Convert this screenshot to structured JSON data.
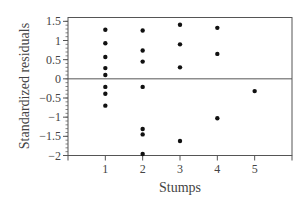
{
  "chart_data": {
    "type": "scatter",
    "title": "",
    "xlabel": "Stumps",
    "ylabel": "Standardized residuals",
    "xlim": [
      0,
      6
    ],
    "ylim": [
      -2,
      1.6
    ],
    "xticks": [
      1,
      2,
      3,
      4,
      5
    ],
    "xtick_labels": [
      "1",
      "2",
      "3",
      "4",
      "5"
    ],
    "yticks": [
      1.5,
      1,
      0.5,
      0,
      -0.5,
      -1,
      -1.5,
      -2
    ],
    "ytick_labels": [
      "1.5",
      "1",
      "0.5",
      "0",
      "−0.5",
      "−1",
      "−1.5",
      "−2"
    ],
    "y_minor_tick_step": 0.1,
    "reference_line": {
      "y": 0
    },
    "grid": false,
    "legend": null,
    "series": [
      {
        "name": "residuals",
        "points": [
          {
            "x": 1,
            "y": 1.28
          },
          {
            "x": 1,
            "y": 0.93
          },
          {
            "x": 1,
            "y": 0.57
          },
          {
            "x": 1,
            "y": 0.28
          },
          {
            "x": 1,
            "y": 0.1
          },
          {
            "x": 1,
            "y": -0.21
          },
          {
            "x": 1,
            "y": -0.39
          },
          {
            "x": 1,
            "y": -0.7
          },
          {
            "x": 2,
            "y": 1.26
          },
          {
            "x": 2,
            "y": 0.74
          },
          {
            "x": 2,
            "y": 0.45
          },
          {
            "x": 2,
            "y": -0.21
          },
          {
            "x": 2,
            "y": -1.31
          },
          {
            "x": 2,
            "y": -1.45
          },
          {
            "x": 2,
            "y": -1.96
          },
          {
            "x": 3,
            "y": 1.41
          },
          {
            "x": 3,
            "y": 0.9
          },
          {
            "x": 3,
            "y": 0.3
          },
          {
            "x": 3,
            "y": -1.62
          },
          {
            "x": 4,
            "y": 1.33
          },
          {
            "x": 4,
            "y": 0.65
          },
          {
            "x": 4,
            "y": -1.03
          },
          {
            "x": 5,
            "y": -0.32
          }
        ]
      }
    ]
  },
  "colors": {
    "frame": "#555555",
    "points": "#111111",
    "text": "#444444"
  }
}
